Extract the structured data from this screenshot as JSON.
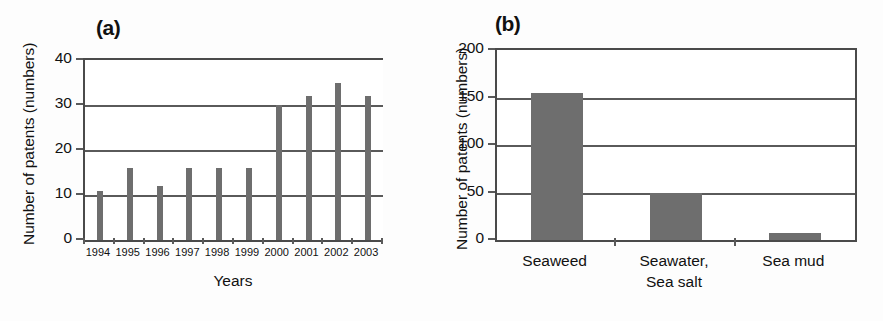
{
  "figure": {
    "background": "#fdfdfd",
    "bar_color": "#6e6e6e",
    "axis_color": "#4a4a4a",
    "grid_color": "#5a5a5a"
  },
  "panels": [
    {
      "id": "a",
      "label": "(a)",
      "ylabel": "Number of patents (numbers)",
      "xlabel": "Years"
    },
    {
      "id": "b",
      "label": "(b)",
      "ylabel": "Number of patents (numbers)",
      "xlabel": ""
    }
  ],
  "chart_data": [
    {
      "type": "bar",
      "title": "(a)",
      "xlabel": "Years",
      "ylabel": "Number of patents (numbers)",
      "categories": [
        "1994",
        "1995",
        "1996",
        "1997",
        "1998",
        "1999",
        "2000",
        "2001",
        "2002",
        "2003"
      ],
      "values": [
        11,
        16,
        12,
        16,
        16,
        16,
        30,
        32,
        35,
        32
      ],
      "ylim": [
        0,
        40
      ],
      "yticks": [
        0,
        10,
        20,
        30,
        40
      ],
      "grid": true,
      "legend": "none",
      "bar_style": "thin-vertical-lines"
    },
    {
      "type": "bar",
      "title": "(b)",
      "xlabel": "",
      "ylabel": "Number of patents (numbers)",
      "categories": [
        "Seaweed",
        "Seawater,\nSea salt",
        "Sea mud"
      ],
      "values": [
        155,
        49,
        7
      ],
      "ylim": [
        0,
        200
      ],
      "yticks": [
        0,
        50,
        100,
        150,
        200
      ],
      "grid": true,
      "legend": "none",
      "bar_style": "wide-filled"
    }
  ]
}
